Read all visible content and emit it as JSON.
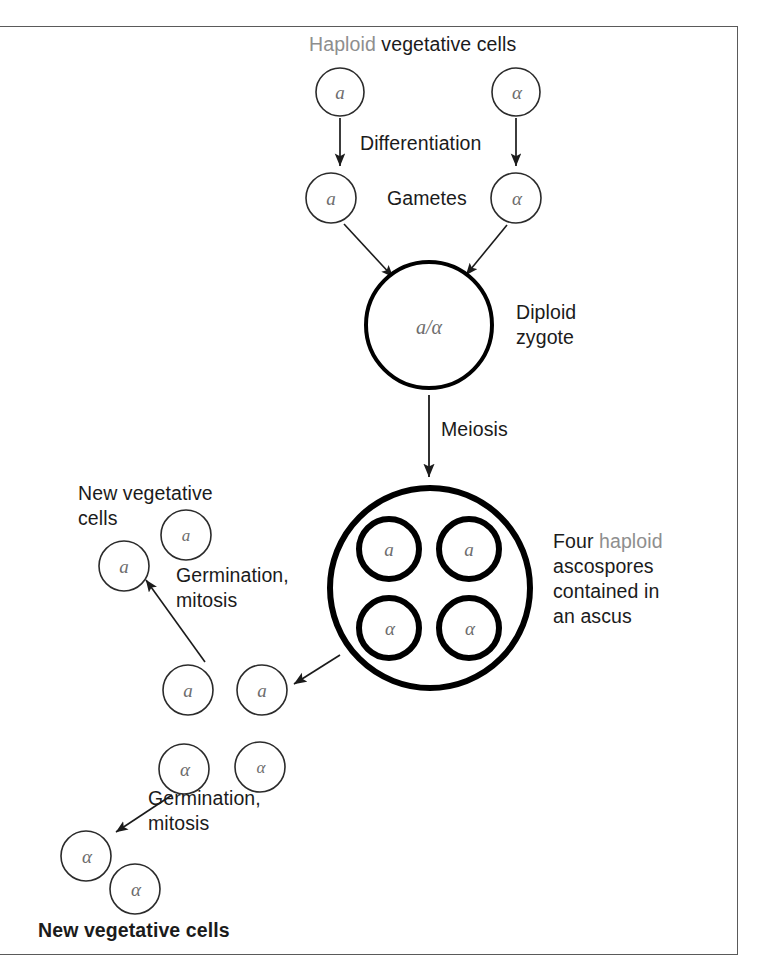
{
  "diagram": {
    "title_top": {
      "word_grey": "Haploid",
      "word_black": " vegetative cells"
    },
    "labels": {
      "differentiation": "Differentiation",
      "gametes": "Gametes",
      "diploid": "Diploid",
      "zygote": "zygote",
      "meiosis": "Meiosis",
      "new_veg_1": "New vegetative",
      "new_veg_1b": "cells",
      "germination_1": "Germination,",
      "mitosis_1": "mitosis",
      "germination_2": "Germination,",
      "mitosis_2": "mitosis",
      "new_veg_bottom": "New vegetative cells",
      "ascus_line1_black": "Four ",
      "ascus_line1_grey": "haploid",
      "ascus_line2": "ascospores",
      "ascus_line3": "contained in",
      "ascus_line4": "an ascus"
    },
    "mating_types": {
      "a": "a",
      "alpha": "α",
      "zygote": "a/α"
    },
    "cells": {
      "vegetative_top": [
        {
          "id": "veg-a",
          "type": "a",
          "cx": 340,
          "cy": 92,
          "r": 24
        },
        {
          "id": "veg-alpha",
          "type": "α",
          "cx": 516,
          "cy": 92,
          "r": 24
        }
      ],
      "gametes": [
        {
          "id": "gam-a",
          "type": "a",
          "cx": 331,
          "cy": 198,
          "r": 25
        },
        {
          "id": "gam-alpha",
          "type": "α",
          "cx": 516,
          "cy": 198,
          "r": 25
        }
      ],
      "zygote": {
        "id": "zygote",
        "type": "a/α",
        "cx": 429,
        "cy": 325,
        "r": 63
      },
      "ascus": {
        "id": "ascus",
        "cx": 430,
        "cy": 588,
        "r": 100
      },
      "ascospores": [
        {
          "id": "spore-a-1",
          "type": "a",
          "cx": 389,
          "cy": 549,
          "r": 30
        },
        {
          "id": "spore-a-2",
          "type": "a",
          "cx": 469,
          "cy": 549,
          "r": 30
        },
        {
          "id": "spore-alpha-1",
          "type": "α",
          "cx": 389,
          "cy": 628,
          "r": 30
        },
        {
          "id": "spore-alpha-2",
          "type": "α",
          "cx": 469,
          "cy": 628,
          "r": 30
        }
      ],
      "a_progeny": [
        {
          "id": "a-prog-1",
          "cx": 186,
          "cy": 535,
          "r": 25
        },
        {
          "id": "a-prog-2",
          "cx": 124,
          "cy": 566,
          "r": 25
        },
        {
          "id": "a-germ-1",
          "cx": 188,
          "cy": 690,
          "r": 25
        },
        {
          "id": "a-germ-2",
          "cx": 262,
          "cy": 690,
          "r": 25
        }
      ],
      "alpha_progeny": [
        {
          "id": "alpha-germ-1",
          "cx": 184,
          "cy": 769,
          "r": 25
        },
        {
          "id": "alpha-germ-2",
          "cx": 260,
          "cy": 767,
          "r": 25
        },
        {
          "id": "alpha-prog-1",
          "cx": 86,
          "cy": 856,
          "r": 25
        },
        {
          "id": "alpha-prog-2",
          "cx": 135,
          "cy": 889,
          "r": 25
        }
      ]
    },
    "colors": {
      "frame": "#5a5a5a",
      "stroke_thin": "#2b2b2b",
      "stroke_thick": "#000000",
      "text": "#1b1b1b",
      "text_grey": "#8e8e8e",
      "mark": "#6d6d6d"
    }
  }
}
